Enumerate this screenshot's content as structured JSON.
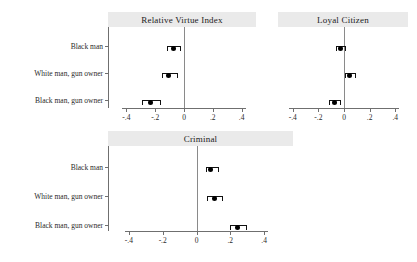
{
  "figure": {
    "background_color": "#ffffff",
    "panel_header_color": "#eaeaea",
    "point_color": "#000000",
    "axis_color": "#6f6f6f",
    "zero_line_color": "#8a8a8a"
  },
  "chart_data": {
    "type": "scatter",
    "title": "",
    "xlabel": "",
    "ylabel": "",
    "xlim": [
      -0.5,
      0.5
    ],
    "xticks": [
      -0.4,
      -0.2,
      0,
      0.2,
      0.4
    ],
    "xtick_labels": [
      "-.4",
      "-.2",
      "0",
      ".2",
      ".4"
    ],
    "grid": false,
    "legend": "none",
    "reference_line": 0,
    "categories": [
      "Black man",
      "White man, gun owner",
      "Black man, gun owner"
    ],
    "panels": [
      {
        "title": "Relative Virtue Index",
        "position": "top-left",
        "points": [
          {
            "category": "Black man",
            "estimate": -0.07,
            "ci_low": -0.115,
            "ci_high": -0.025
          },
          {
            "category": "White man, gun owner",
            "estimate": -0.105,
            "ci_low": -0.155,
            "ci_high": -0.05
          },
          {
            "category": "Black man, gun owner",
            "estimate": -0.235,
            "ci_low": -0.295,
            "ci_high": -0.17
          }
        ]
      },
      {
        "title": "Loyal Citizen",
        "position": "top-right",
        "points": [
          {
            "category": "Black man",
            "estimate": -0.025,
            "ci_low": -0.06,
            "ci_high": 0.01
          },
          {
            "category": "White man, gun owner",
            "estimate": 0.04,
            "ci_low": 0.005,
            "ci_high": 0.085
          },
          {
            "category": "Black man, gun owner",
            "estimate": -0.075,
            "ci_low": -0.12,
            "ci_high": -0.03
          }
        ]
      },
      {
        "title": "Criminal",
        "position": "bottom-center",
        "points": [
          {
            "category": "Black man",
            "estimate": 0.085,
            "ci_low": 0.055,
            "ci_high": 0.125
          },
          {
            "category": "White man, gun owner",
            "estimate": 0.105,
            "ci_low": 0.065,
            "ci_high": 0.15
          },
          {
            "category": "Black man, gun owner",
            "estimate": 0.245,
            "ci_low": 0.2,
            "ci_high": 0.29
          }
        ]
      }
    ]
  }
}
